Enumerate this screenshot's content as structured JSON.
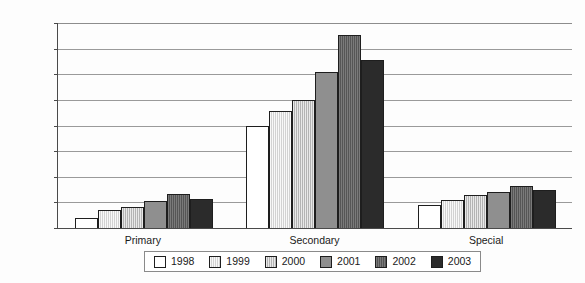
{
  "chart_data": {
    "type": "bar",
    "title": "",
    "subtitle": "",
    "xlabel": "",
    "ylabel": "",
    "categories": [
      "Primary",
      "Secondary",
      "Special"
    ],
    "series": [
      {
        "name": "1998",
        "color": "#ffffff",
        "values": [
          4000,
          40000,
          9000
        ]
      },
      {
        "name": "1999",
        "color": "#d2d2d2",
        "values": [
          7000,
          45500,
          11000
        ]
      },
      {
        "name": "2000",
        "color": "#b3b3b3",
        "values": [
          8200,
          50000,
          13000
        ]
      },
      {
        "name": "2001",
        "color": "#8f8f8f",
        "values": [
          10500,
          61000,
          14000
        ]
      },
      {
        "name": "2002",
        "color": "#555555",
        "values": [
          13200,
          75500,
          16500
        ]
      },
      {
        "name": "2003",
        "color": "#2b2b2b",
        "values": [
          11500,
          65500,
          14800
        ]
      }
    ],
    "ylim": [
      0,
      80000
    ],
    "ytick_step": 10000,
    "ytick_labels": [
      "0",
      "10,000",
      "20,000",
      "30,000",
      "40,000",
      "50,000",
      "60,000",
      "70,000",
      "80,000"
    ],
    "ytick_values": [
      0,
      10000,
      20000,
      30000,
      40000,
      50000,
      60000,
      70000,
      80000
    ],
    "grid": true,
    "grid_axis": "y",
    "legend_position": "bottom",
    "legend_entries": [
      "1998",
      "1999",
      "2000",
      "2001",
      "2002",
      "2003"
    ]
  }
}
